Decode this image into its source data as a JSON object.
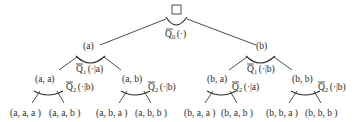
{
  "diagram": {
    "type": "tree",
    "title": "",
    "root": {
      "symbol": "□",
      "operator": {
        "letter": "Q",
        "index": "0",
        "arg": "(·)"
      }
    },
    "level1": [
      {
        "label": "(a)",
        "operator": {
          "letter": "Q",
          "index": "1",
          "arg": "(·|a)"
        },
        "children": [
          {
            "label": "(a, a)",
            "operator": {
              "letter": "Q",
              "index": "2",
              "arg": "(·|b)"
            },
            "leaves": [
              "(a, a, a )",
              "(a, a, b )"
            ]
          },
          {
            "label": "(a, b)",
            "operator": {
              "letter": "Q",
              "index": "2",
              "arg": "(·|b)"
            },
            "leaves": [
              "(a, b, a )",
              "(a, b, b )"
            ]
          }
        ]
      },
      {
        "label": "(b)",
        "operator": {
          "letter": "Q",
          "index": "1",
          "arg": "(·|b)"
        },
        "children": [
          {
            "label": "(b, a)",
            "operator": {
              "letter": "Q",
              "index": "2",
              "arg": "(·|a)"
            },
            "leaves": [
              "(b, a, a )",
              "(b, a, b )"
            ]
          },
          {
            "label": "(b, b)",
            "operator": {
              "letter": "Q",
              "index": "2",
              "arg": "(·|b)"
            },
            "leaves": [
              "(b, b, a )",
              "(b, b, b )"
            ]
          }
        ]
      }
    ]
  }
}
